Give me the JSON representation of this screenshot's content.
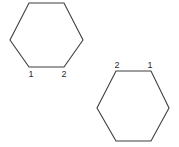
{
  "figure": {
    "width": 179,
    "height": 147,
    "background_color": "#ffffff",
    "stroke_color": "#3f3f3f",
    "label_color": "#2b2b2b",
    "shape_count": 2
  },
  "shapes": [
    {
      "id": "hexagon-top-left",
      "type": "hexagon",
      "fill": "none",
      "points": "29,3 64,3 83,40 64,67 29,67 10,40",
      "labels": [
        {
          "text": "1",
          "x": 31,
          "y": 77,
          "position": "below-bottom-left-vertex"
        },
        {
          "text": "2",
          "x": 64,
          "y": 77,
          "position": "below-bottom-right-vertex"
        }
      ]
    },
    {
      "id": "hexagon-bottom-right",
      "type": "hexagon",
      "fill": "none",
      "points": "116,71 151,71 169,108 151,141 116,141 97,108",
      "labels": [
        {
          "text": "2",
          "x": 117,
          "y": 68,
          "position": "above-top-left-vertex"
        },
        {
          "text": "1",
          "x": 150,
          "y": 68,
          "position": "above-top-right-vertex"
        }
      ]
    }
  ]
}
